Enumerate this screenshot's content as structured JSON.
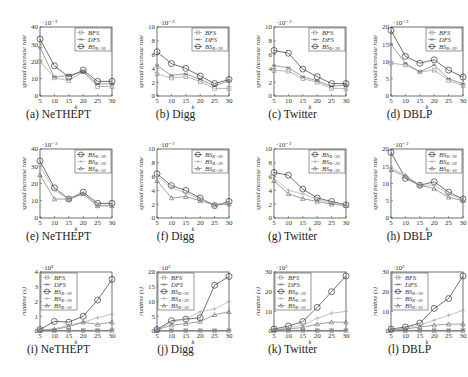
{
  "figure": {
    "rows": 3,
    "cols": 4
  },
  "chart_data": [
    {
      "id": "a",
      "caption": "(a) NeTHEPT",
      "type": "line",
      "xlabel": "k",
      "ylabel": "spread increase rate",
      "multiplier": "·10⁻²",
      "x": [
        5,
        10,
        15,
        20,
        25,
        30
      ],
      "ylim": [
        0,
        40
      ],
      "yticks": [
        0,
        10,
        20,
        30,
        40
      ],
      "legend_position": "top-right",
      "series": [
        {
          "name": "BFS",
          "marker": "square",
          "color": "#999999",
          "values": [
            20,
            10.5,
            9,
            14,
            5.5,
            5.5
          ]
        },
        {
          "name": "DFS",
          "marker": "star",
          "color": "#777777",
          "values": [
            28,
            11,
            12,
            14,
            7,
            7
          ]
        },
        {
          "name": "BS_{B=30}",
          "marker": "circle",
          "color": "#333333",
          "values": [
            33,
            17.5,
            11,
            15,
            8.5,
            8.5
          ]
        }
      ]
    },
    {
      "id": "b",
      "caption": "(b) Digg",
      "type": "line",
      "xlabel": "k",
      "ylabel": "spread increase rate",
      "multiplier": "·10⁻²",
      "x": [
        5,
        10,
        15,
        20,
        25,
        30
      ],
      "ylim": [
        0,
        10
      ],
      "yticks": [
        0,
        2,
        4,
        6,
        8,
        10
      ],
      "legend_position": "top-right",
      "series": [
        {
          "name": "BFS",
          "marker": "square",
          "color": "#999999",
          "values": [
            3.2,
            2.6,
            2.8,
            2.1,
            1.1,
            1.1
          ]
        },
        {
          "name": "DFS",
          "marker": "star",
          "color": "#777777",
          "values": [
            4.4,
            3.0,
            3.2,
            2.4,
            1.5,
            2.2
          ]
        },
        {
          "name": "BS_{B=30}",
          "marker": "circle",
          "color": "#333333",
          "values": [
            6.4,
            4.7,
            4.0,
            2.9,
            1.8,
            2.4
          ]
        }
      ]
    },
    {
      "id": "c",
      "caption": "(c) Twitter",
      "type": "line",
      "xlabel": "k",
      "ylabel": "spread increase rate",
      "multiplier": "·10⁻²",
      "x": [
        5,
        10,
        15,
        20,
        25,
        30
      ],
      "ylim": [
        0,
        10
      ],
      "yticks": [
        0,
        2,
        4,
        6,
        8,
        10
      ],
      "legend_position": "top-right",
      "series": [
        {
          "name": "BFS",
          "marker": "square",
          "color": "#999999",
          "values": [
            3.7,
            3.6,
            2.5,
            2.0,
            1.1,
            1.1
          ]
        },
        {
          "name": "DFS",
          "marker": "star",
          "color": "#777777",
          "values": [
            4.4,
            4.1,
            2.8,
            2.2,
            1.4,
            1.6
          ]
        },
        {
          "name": "BS_{B=30}",
          "marker": "circle",
          "color": "#333333",
          "values": [
            6.6,
            6.2,
            3.9,
            2.8,
            1.8,
            1.8
          ]
        }
      ]
    },
    {
      "id": "d",
      "caption": "(d) DBLP",
      "type": "line",
      "xlabel": "k",
      "ylabel": "spread increase rate",
      "multiplier": "·10⁻²",
      "x": [
        5,
        10,
        15,
        20,
        25,
        30
      ],
      "ylim": [
        0,
        20
      ],
      "yticks": [
        0,
        5,
        10,
        15,
        20
      ],
      "legend_position": "top-right",
      "series": [
        {
          "name": "BFS",
          "marker": "square",
          "color": "#999999",
          "values": [
            9.5,
            9.0,
            7.0,
            7.5,
            4.5,
            3.0
          ]
        },
        {
          "name": "DFS",
          "marker": "star",
          "color": "#777777",
          "values": [
            15,
            9.5,
            7.0,
            9.0,
            5.0,
            3.5
          ]
        },
        {
          "name": "BS_{B=30}",
          "marker": "circle",
          "color": "#333333",
          "values": [
            19,
            11.5,
            9.5,
            10.5,
            7.5,
            5.5
          ]
        }
      ]
    },
    {
      "id": "e",
      "caption": "(e) NeTHEPT",
      "type": "line",
      "xlabel": "k",
      "ylabel": "spread increase rate",
      "multiplier": "·10⁻²",
      "x": [
        5,
        10,
        15,
        20,
        25,
        30
      ],
      "ylim": [
        0,
        40
      ],
      "yticks": [
        0,
        10,
        20,
        30,
        40
      ],
      "legend_position": "top-right",
      "series": [
        {
          "name": "BS_{B=30}",
          "marker": "circle",
          "color": "#333333",
          "values": [
            33,
            17.5,
            11,
            15,
            8.5,
            8.5
          ]
        },
        {
          "name": "BS_{B=20}",
          "marker": "plus",
          "color": "#aaaaaa",
          "values": [
            30,
            16,
            11,
            14,
            7.5,
            7.5
          ]
        },
        {
          "name": "BS_{B=10}",
          "marker": "triangle",
          "color": "#777777",
          "values": [
            25,
            11,
            11,
            14,
            7,
            7
          ]
        }
      ]
    },
    {
      "id": "f",
      "caption": "(f) Digg",
      "type": "line",
      "xlabel": "k",
      "ylabel": "spread increase rate",
      "multiplier": "·10⁻²",
      "x": [
        5,
        10,
        15,
        20,
        25,
        30
      ],
      "ylim": [
        0,
        10
      ],
      "yticks": [
        0,
        2,
        4,
        6,
        8,
        10
      ],
      "legend_position": "top-right",
      "series": [
        {
          "name": "BS_{B=30}",
          "marker": "circle",
          "color": "#333333",
          "values": [
            6.4,
            4.7,
            4.0,
            2.9,
            1.8,
            2.4
          ]
        },
        {
          "name": "BS_{B=20}",
          "marker": "plus",
          "color": "#aaaaaa",
          "values": [
            6.0,
            4.4,
            3.6,
            2.8,
            1.9,
            2.2
          ]
        },
        {
          "name": "BS_{B=10}",
          "marker": "triangle",
          "color": "#777777",
          "values": [
            5.4,
            2.9,
            3.1,
            2.5,
            1.9,
            2.0
          ]
        }
      ]
    },
    {
      "id": "g",
      "caption": "(g) Twitter",
      "type": "line",
      "xlabel": "k",
      "ylabel": "spread increase rate",
      "multiplier": "·10⁻²",
      "x": [
        5,
        10,
        15,
        20,
        25,
        30
      ],
      "ylim": [
        0,
        10
      ],
      "yticks": [
        0,
        2,
        4,
        6,
        8,
        10
      ],
      "legend_position": "top-right",
      "series": [
        {
          "name": "BS_{B=30}",
          "marker": "circle",
          "color": "#333333",
          "values": [
            6.6,
            6.2,
            4.2,
            2.9,
            2.4,
            1.9
          ]
        },
        {
          "name": "BS_{B=20}",
          "marker": "plus",
          "color": "#aaaaaa",
          "values": [
            5.8,
            4.0,
            3.5,
            2.7,
            2.2,
            1.9
          ]
        },
        {
          "name": "BS_{B=10}",
          "marker": "triangle",
          "color": "#777777",
          "values": [
            5.4,
            3.5,
            2.8,
            2.4,
            2.0,
            1.8
          ]
        }
      ]
    },
    {
      "id": "h",
      "caption": "(h) DBLP",
      "type": "line",
      "xlabel": "k",
      "ylabel": "spread increase rate",
      "multiplier": "·10⁻²",
      "x": [
        5,
        10,
        15,
        20,
        25,
        30
      ],
      "ylim": [
        0,
        20
      ],
      "yticks": [
        0,
        5,
        10,
        15,
        20
      ],
      "legend_position": "top-right",
      "series": [
        {
          "name": "BS_{B=30}",
          "marker": "circle",
          "color": "#333333",
          "values": [
            19,
            11.5,
            9.5,
            10.5,
            7.5,
            5.5
          ]
        },
        {
          "name": "BS_{B=20}",
          "marker": "plus",
          "color": "#aaaaaa",
          "values": [
            14.5,
            12.5,
            9.5,
            9.5,
            7.0,
            5.2
          ]
        },
        {
          "name": "BS_{B=10}",
          "marker": "triangle",
          "color": "#777777",
          "values": [
            14,
            12,
            9.5,
            8.5,
            6.0,
            5.0
          ]
        }
      ]
    },
    {
      "id": "i",
      "caption": "(i) NeTHEPT",
      "type": "line",
      "xlabel": "k",
      "ylabel": "runtime (s)",
      "multiplier": "·10¹",
      "x": [
        5,
        10,
        15,
        20,
        25,
        30
      ],
      "ylim": [
        0,
        4
      ],
      "yticks": [
        0,
        1,
        2,
        3,
        4
      ],
      "legend_position": "top-left",
      "series": [
        {
          "name": "BFS",
          "marker": "square",
          "color": "#999999",
          "values": [
            0.02,
            0.02,
            0.03,
            0.03,
            0.03,
            0.03
          ]
        },
        {
          "name": "DFS",
          "marker": "star",
          "color": "#777777",
          "values": [
            0.02,
            0.03,
            0.04,
            0.04,
            0.05,
            0.05
          ]
        },
        {
          "name": "BS_{B=30}",
          "marker": "circle",
          "color": "#333333",
          "values": [
            0.1,
            0.65,
            0.6,
            1.0,
            2.1,
            3.5
          ]
        },
        {
          "name": "BS_{B=20}",
          "marker": "plus",
          "color": "#aaaaaa",
          "values": [
            0.05,
            0.15,
            0.4,
            0.6,
            0.9,
            1.15
          ]
        },
        {
          "name": "BS_{B=10}",
          "marker": "triangle",
          "color": "#777777",
          "values": [
            0.05,
            0.1,
            0.3,
            0.6,
            0.45,
            0.6
          ]
        }
      ]
    },
    {
      "id": "j",
      "caption": "(j) Digg",
      "type": "line",
      "xlabel": "k",
      "ylabel": "runtime (s)",
      "multiplier": "·10²",
      "x": [
        5,
        10,
        15,
        20,
        25,
        30
      ],
      "ylim": [
        0,
        20
      ],
      "yticks": [
        0,
        5,
        10,
        15,
        20
      ],
      "legend_position": "top-left",
      "series": [
        {
          "name": "BFS",
          "marker": "square",
          "color": "#999999",
          "values": [
            0.1,
            0.1,
            0.1,
            0.1,
            0.1,
            0.1
          ]
        },
        {
          "name": "DFS",
          "marker": "star",
          "color": "#777777",
          "values": [
            0.1,
            0.2,
            0.2,
            0.2,
            0.2,
            0.2
          ]
        },
        {
          "name": "BS_{B=30}",
          "marker": "circle",
          "color": "#333333",
          "values": [
            0.5,
            3.5,
            4.0,
            4.5,
            15.5,
            18.5
          ]
        },
        {
          "name": "BS_{B=20}",
          "marker": "plus",
          "color": "#aaaaaa",
          "values": [
            0.5,
            2.8,
            4.2,
            6.5,
            7.5,
            10
          ]
        },
        {
          "name": "BS_{B=10}",
          "marker": "triangle",
          "color": "#777777",
          "values": [
            0.4,
            2.0,
            2.5,
            3.2,
            5.5,
            6.5
          ]
        }
      ]
    },
    {
      "id": "k",
      "caption": "(k) Twitter",
      "type": "line",
      "xlabel": "k",
      "ylabel": "runtime (s)",
      "multiplier": "·10²",
      "x": [
        5,
        10,
        15,
        20,
        25,
        30
      ],
      "ylim": [
        0,
        30
      ],
      "yticks": [
        0,
        10,
        20,
        30
      ],
      "legend_position": "top-left",
      "series": [
        {
          "name": "BFS",
          "marker": "square",
          "color": "#999999",
          "values": [
            0.2,
            0.2,
            0.2,
            0.2,
            0.2,
            0.2
          ]
        },
        {
          "name": "DFS",
          "marker": "star",
          "color": "#777777",
          "values": [
            0.3,
            0.3,
            0.3,
            0.3,
            0.3,
            0.3
          ]
        },
        {
          "name": "BS_{B=30}",
          "marker": "circle",
          "color": "#333333",
          "values": [
            1.0,
            2.5,
            4.8,
            12,
            20,
            28
          ]
        },
        {
          "name": "BS_{B=20}",
          "marker": "plus",
          "color": "#aaaaaa",
          "values": [
            0.8,
            1.5,
            3.0,
            6.5,
            9.0,
            10
          ]
        },
        {
          "name": "BS_{B=10}",
          "marker": "triangle",
          "color": "#777777",
          "values": [
            0.5,
            1.0,
            1.8,
            3.5,
            4.5,
            4.5
          ]
        }
      ]
    },
    {
      "id": "l",
      "caption": "(l) DBLP",
      "type": "line",
      "xlabel": "k",
      "ylabel": "runtime (s)",
      "multiplier": "·10²",
      "x": [
        5,
        10,
        15,
        20,
        25,
        30
      ],
      "ylim": [
        0,
        30
      ],
      "yticks": [
        0,
        10,
        20,
        30
      ],
      "legend_position": "top-left",
      "series": [
        {
          "name": "BFS",
          "marker": "square",
          "color": "#999999",
          "values": [
            0.2,
            0.2,
            0.2,
            0.2,
            0.2,
            0.2
          ]
        },
        {
          "name": "DFS",
          "marker": "star",
          "color": "#777777",
          "values": [
            0.3,
            0.3,
            0.3,
            0.3,
            0.3,
            0.3
          ]
        },
        {
          "name": "BS_{B=30}",
          "marker": "circle",
          "color": "#333333",
          "values": [
            1.0,
            2.0,
            4.0,
            11.5,
            16.5,
            28
          ]
        },
        {
          "name": "BS_{B=20}",
          "marker": "plus",
          "color": "#aaaaaa",
          "values": [
            0.8,
            1.5,
            3.0,
            5.5,
            8.0,
            10.5
          ]
        },
        {
          "name": "BS_{B=10}",
          "marker": "triangle",
          "color": "#777777",
          "values": [
            0.5,
            1.0,
            2.0,
            3.0,
            3.5,
            3.5
          ]
        }
      ]
    }
  ]
}
